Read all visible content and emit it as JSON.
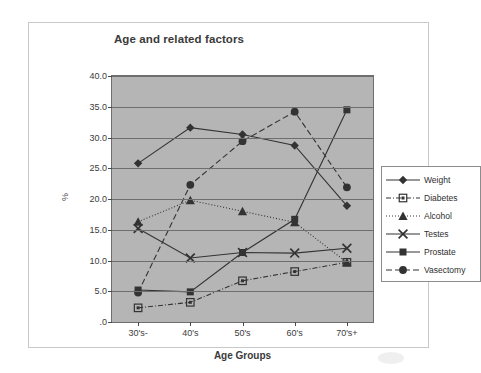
{
  "chart_data": {
    "type": "line",
    "title": "Age and related factors",
    "xlabel": "Age Groups",
    "ylabel": "%",
    "categories": [
      "30's-",
      "40's",
      "50's",
      "60's",
      "70's+"
    ],
    "ylim": [
      0,
      40
    ],
    "yticks": [
      ".0",
      "5.0",
      "10.0",
      "15.0",
      "20.0",
      "25.0",
      "30.0",
      "35.0",
      "40.0"
    ],
    "ytick_values": [
      0,
      5,
      10,
      15,
      20,
      25,
      30,
      35,
      40
    ],
    "grid": true,
    "legend_position": "right",
    "plot_background": "#b5b5b5",
    "series": [
      {
        "name": "Weight",
        "marker": "diamond",
        "line": "solid",
        "color": "#333333",
        "values": [
          25.8,
          31.6,
          30.5,
          28.7,
          18.9
        ]
      },
      {
        "name": "Diabetes",
        "marker": "open-square",
        "line": "dash-dot",
        "color": "#333333",
        "values": [
          2.3,
          3.2,
          6.7,
          8.2,
          9.7
        ]
      },
      {
        "name": "Alcohol",
        "marker": "triangle",
        "line": "dotted",
        "color": "#333333",
        "values": [
          16.3,
          19.8,
          18.0,
          16.2,
          9.7
        ]
      },
      {
        "name": "Testes",
        "marker": "cross",
        "line": "solid",
        "color": "#333333",
        "values": [
          15.2,
          10.4,
          11.3,
          11.2,
          12.0
        ]
      },
      {
        "name": "Prostate",
        "marker": "square",
        "line": "solid",
        "color": "#333333",
        "values": [
          5.2,
          4.9,
          11.3,
          16.7,
          34.5
        ]
      },
      {
        "name": "Vasectomy",
        "marker": "circle",
        "line": "dashed",
        "color": "#333333",
        "values": [
          4.8,
          22.3,
          29.4,
          34.2,
          21.9
        ]
      }
    ]
  },
  "legend": {
    "items": [
      {
        "label": "Weight"
      },
      {
        "label": "Diabetes"
      },
      {
        "label": "Alcohol"
      },
      {
        "label": "Testes"
      },
      {
        "label": "Prostate"
      },
      {
        "label": "Vasectomy"
      }
    ]
  }
}
